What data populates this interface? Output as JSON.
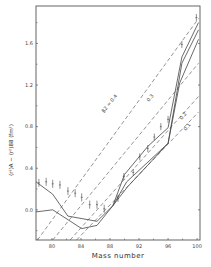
{
  "chart_data": {
    "type": "line",
    "title": "",
    "xlabel": "Mass number",
    "ylabel": "⟨r²⟩A − ⟨r²⟩88 (fm²)",
    "xlim": [
      77.8,
      100.4
    ],
    "ylim": [
      -0.29,
      1.96
    ],
    "grid": false,
    "legend": "none",
    "x_ticks": [
      80,
      84,
      88,
      92,
      96,
      100
    ],
    "x_tick_labels": [
      "80",
      "84",
      "88",
      "92",
      "96",
      "100"
    ],
    "y_ticks": [
      0.0,
      0.4,
      0.8,
      1.2,
      1.6
    ],
    "y_tick_labels": [
      "0.0",
      "0.4",
      "0.8",
      "1.2",
      "1.6"
    ],
    "experimental_points": {
      "name": "data",
      "x": [
        78.2,
        79.2,
        80.1,
        81.1,
        82.2,
        83.2,
        84.1,
        85.2,
        86.2,
        87.2,
        89.1,
        89.9,
        91.2,
        92.1,
        93.2,
        94.1,
        95.0,
        96.0,
        97.9,
        99.9
      ],
      "y": [
        0.26,
        0.27,
        0.25,
        0.24,
        0.18,
        0.16,
        0.12,
        0.05,
        0.05,
        0.01,
        0.11,
        0.32,
        0.36,
        0.51,
        0.59,
        0.7,
        0.8,
        0.87,
        1.59,
        1.85
      ]
    },
    "series": [
      {
        "name": "calculation 1",
        "style": "solid",
        "x": [
          77.8,
          80.1,
          82.2,
          86.2,
          88.4,
          90.0,
          93.2,
          96.0,
          97.9,
          100.2
        ],
        "y": [
          0.27,
          0.15,
          -0.06,
          -0.11,
          0.04,
          0.34,
          0.61,
          0.79,
          1.47,
          1.8
        ]
      },
      {
        "name": "calculation 2",
        "style": "solid",
        "x": [
          77.8,
          80.1,
          84.1,
          86.2,
          88.4,
          90.3,
          96.0,
          97.9,
          100.2
        ],
        "y": [
          -0.02,
          0.0,
          -0.18,
          -0.15,
          0.04,
          0.27,
          0.64,
          1.41,
          1.73
        ]
      },
      {
        "name": "calculation 3",
        "style": "solid",
        "x": [
          88.4,
          90.4,
          96.0,
          97.6,
          100.2
        ],
        "y": [
          0.04,
          0.22,
          0.64,
          1.22,
          1.64
        ]
      },
      {
        "name": "β2 = 0.4",
        "style": "dashed",
        "x": [
          78.0,
          100.2
        ],
        "y": [
          -0.29,
          1.84
        ]
      },
      {
        "name": "0.3",
        "style": "dashed",
        "x": [
          80.1,
          100.2
        ],
        "y": [
          -0.29,
          1.41
        ]
      },
      {
        "name": "0.2",
        "style": "dashed",
        "x": [
          82.5,
          100.2
        ],
        "y": [
          -0.29,
          1.09
        ]
      },
      {
        "name": "0.1",
        "style": "dashed",
        "x": [
          83.4,
          100.2
        ],
        "y": [
          -0.29,
          0.94
        ]
      }
    ],
    "annotations": [
      "β2 = 0.4",
      "0.3",
      "0.2",
      "0.1"
    ]
  }
}
